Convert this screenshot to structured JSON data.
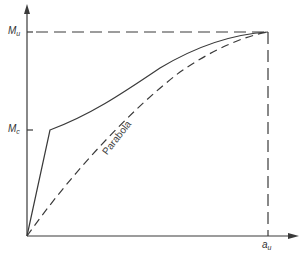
{
  "diagram": {
    "type": "moment-curvature sketch",
    "y_axis": {
      "label_main": "M",
      "ticks": [
        {
          "main": "M",
          "sub": "u",
          "meaning": "ultimate moment"
        },
        {
          "main": "M",
          "sub": "c",
          "meaning": "cracking moment"
        }
      ]
    },
    "x_axis": {
      "ticks": [
        {
          "main": "a",
          "sub": "u"
        }
      ]
    },
    "curves": [
      {
        "name": "actual",
        "style": "solid",
        "description": "steep linear rise to Mc then curved rise to Mu at au"
      },
      {
        "name": "parabola",
        "style": "dashed",
        "label": "Parabola"
      }
    ],
    "guides": [
      {
        "name": "Mu horizontal",
        "style": "dashed"
      },
      {
        "name": "au vertical",
        "style": "dashed"
      }
    ],
    "colors": {
      "line": "#3a3a3a",
      "background": "#ffffff"
    }
  },
  "labels": {
    "mu_main": "M",
    "mu_sub": "u",
    "mc_main": "M",
    "mc_sub": "c",
    "au_main": "a",
    "au_sub": "u",
    "parabola": "Parabola"
  }
}
